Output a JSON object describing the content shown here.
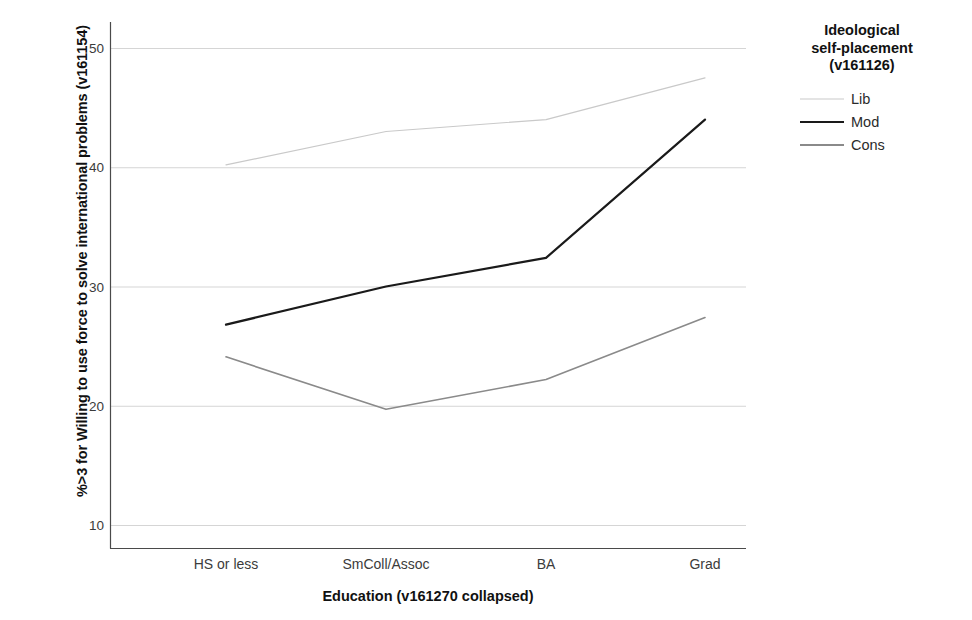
{
  "chart_data": {
    "type": "line",
    "title": "",
    "xlabel": "Education (v161270 collapsed)",
    "ylabel": "%>3 for Willing to use force to solve international problems (v161154)",
    "categories": [
      "HS or less",
      "SmColl/Assoc",
      "BA",
      "Grad"
    ],
    "series": [
      {
        "name": "Lib",
        "values": [
          40.2,
          43.0,
          44.0,
          47.5
        ],
        "color": "#c9c9c9",
        "width": 1.2
      },
      {
        "name": "Mod",
        "values": [
          26.8,
          30.0,
          32.4,
          44.0
        ],
        "color": "#1a1a1a",
        "width": 2.2
      },
      {
        "name": "Cons",
        "values": [
          24.1,
          19.7,
          22.2,
          27.4
        ],
        "color": "#8a8a8a",
        "width": 1.6
      }
    ],
    "ylim": [
      7.2,
      52.3
    ],
    "yticks": [
      10,
      20,
      30,
      40,
      50
    ],
    "ytick_labels": [
      "10",
      "20",
      "30",
      "40",
      "50"
    ],
    "grid": true,
    "grid_color": "#d5d5d5",
    "legend_position": "right",
    "legend_title": "Ideological\nself-placement\n(v161126)"
  },
  "axes": {
    "y_title": "%>3 for Willing to use force to solve international problems (v161154)",
    "x_title": "Education (v161270 collapsed)",
    "y_tick_labels": [
      "50",
      "40",
      "30",
      "20",
      "10"
    ],
    "x_tick_labels": [
      "HS or less",
      "SmColl/Assoc",
      "BA",
      "Grad"
    ]
  },
  "legend": {
    "title_line1": "Ideological",
    "title_line2": "self-placement",
    "title_line3": "(v161126)",
    "items": [
      {
        "label": "Lib"
      },
      {
        "label": "Mod"
      },
      {
        "label": "Cons"
      }
    ]
  }
}
